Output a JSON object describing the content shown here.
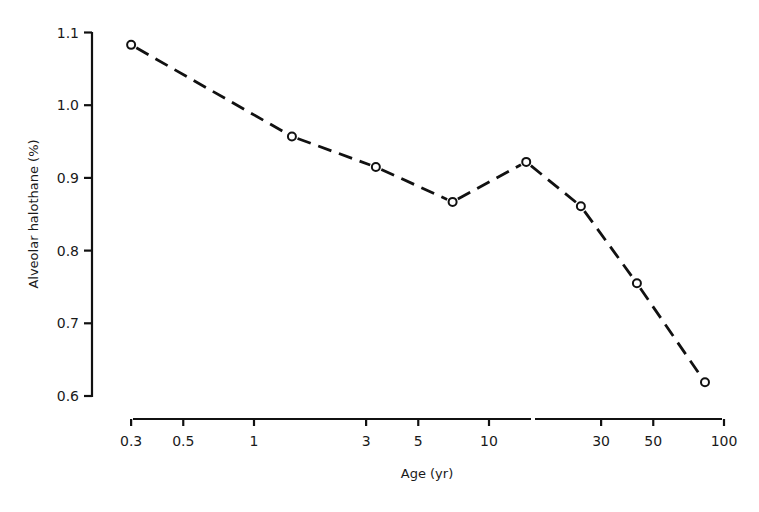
{
  "chart_data": {
    "type": "line",
    "title": "",
    "xlabel": "Age (yr)",
    "ylabel": "Alveolar halothane (%)",
    "xscale": "log",
    "xlim": [
      0.3,
      100
    ],
    "ylim": [
      0.6,
      1.1
    ],
    "grid": false,
    "legend": null,
    "x_ticks": [
      0.3,
      0.5,
      1,
      3,
      5,
      10,
      30,
      50,
      100
    ],
    "x_tick_labels": [
      "0.3",
      "0.5",
      "1",
      "3",
      "5",
      "10",
      "30",
      "50",
      "100"
    ],
    "y_ticks": [
      0.6,
      0.7,
      0.8,
      0.9,
      1.0,
      1.1
    ],
    "y_tick_labels": [
      "0.6",
      "0.7",
      "0.8",
      "0.9",
      "1.0",
      "1.1"
    ],
    "line_style": "dashed",
    "marker": "open-circle",
    "series": [
      {
        "name": "Alveolar halothane MAC",
        "x": [
          0.3,
          1.45,
          3.3,
          7.0,
          14.4,
          24.6,
          42.6,
          83
        ],
        "values": [
          1.083,
          0.957,
          0.915,
          0.867,
          0.922,
          0.861,
          0.755,
          0.619
        ]
      }
    ]
  },
  "axes": {
    "x_title": "Age (yr)",
    "y_title": "Alveolar halothane (%)"
  },
  "colors": {
    "line": "#111111",
    "axis": "#111111",
    "background": "#ffffff"
  }
}
